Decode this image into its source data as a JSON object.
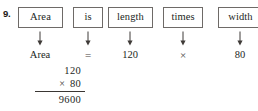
{
  "problem": {
    "number": "9."
  },
  "word_equation": {
    "boxes": [
      {
        "label": "Area",
        "left": 18,
        "width": 45
      },
      {
        "label": "is",
        "left": 73,
        "width": 30
      },
      {
        "label": "length",
        "left": 108,
        "width": 45
      },
      {
        "label": "times",
        "left": 163,
        "width": 40
      },
      {
        "label": "width",
        "left": 218,
        "width": 45
      }
    ],
    "arrows": [
      {
        "icon": "down-arrow-icon",
        "center": 40
      },
      {
        "icon": "down-arrow-icon",
        "center": 88
      },
      {
        "icon": "down-arrow-icon",
        "center": 130
      },
      {
        "icon": "down-arrow-icon",
        "center": 183
      },
      {
        "icon": "down-arrow-icon",
        "center": 240
      }
    ],
    "values": [
      {
        "text": "Area",
        "center": 40,
        "symbol": false
      },
      {
        "text": "=",
        "center": 88,
        "symbol": true
      },
      {
        "text": "120",
        "center": 130,
        "symbol": false
      },
      {
        "text": "×",
        "center": 183,
        "symbol": true
      },
      {
        "text": "80",
        "center": 240,
        "symbol": false
      }
    ]
  },
  "vertical_multiplication": {
    "multiplicand": "120",
    "operator": "×",
    "multiplier": "80",
    "product": "9600"
  }
}
